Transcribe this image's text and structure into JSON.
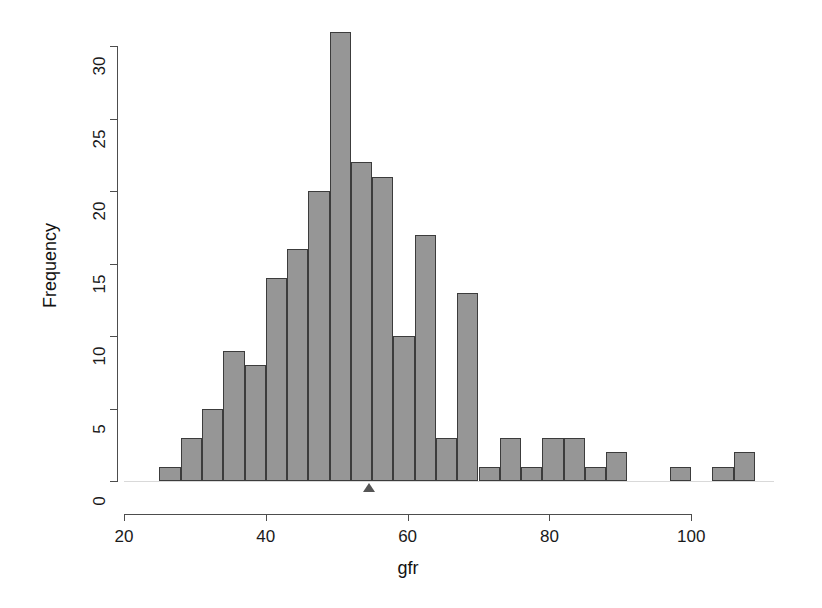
{
  "figure": {
    "width": 822,
    "height": 608,
    "background": "#ffffff",
    "bar_fill": "#969696",
    "bar_stroke": "#3c3c3c",
    "axis_color": "#4d4d4d"
  },
  "labels": {
    "xlabel": "gfr",
    "ylabel": "Frequency"
  },
  "chart_data": {
    "type": "bar",
    "subtype": "histogram",
    "title": "",
    "xlabel": "gfr",
    "ylabel": "Frequency",
    "xlim": [
      20,
      110
    ],
    "ylim": [
      0,
      31
    ],
    "grid": false,
    "legend": null,
    "bin_width": 3,
    "bin_edges": [
      25,
      28,
      31,
      34,
      37,
      40,
      43,
      46,
      49,
      52,
      55,
      58,
      61,
      64,
      67,
      70,
      73,
      76,
      79,
      82,
      85,
      88,
      91,
      94,
      97,
      100,
      103,
      106,
      109
    ],
    "categories": [
      "25-28",
      "28-31",
      "31-34",
      "34-37",
      "37-40",
      "40-43",
      "43-46",
      "46-49",
      "49-52",
      "52-55",
      "55-58",
      "58-61",
      "61-64",
      "64-67",
      "67-70",
      "70-73",
      "73-76",
      "76-79",
      "79-82",
      "82-85",
      "85-88",
      "88-91",
      "91-94",
      "94-97",
      "97-100",
      "100-103",
      "103-106",
      "106-109"
    ],
    "values": [
      1,
      3,
      5,
      9,
      8,
      14,
      16,
      20,
      31,
      22,
      21,
      10,
      17,
      3,
      13,
      1,
      3,
      1,
      3,
      3,
      1,
      2,
      0,
      0,
      1,
      0,
      1,
      2
    ],
    "xticks": [
      20,
      40,
      60,
      80,
      100
    ],
    "xtick_labels": [
      "20",
      "40",
      "60",
      "80",
      "100"
    ],
    "yticks": [
      0,
      5,
      10,
      15,
      20,
      25,
      30
    ],
    "ytick_labels": [
      "0",
      "5",
      "10",
      "15",
      "20",
      "25",
      "30"
    ],
    "annotations": [
      {
        "name": "mean-marker",
        "shape": "triangle",
        "x": 54.5,
        "y": 0
      }
    ]
  },
  "axes_geometry": {
    "x_origin_px": 124,
    "x_scale_px_per_unit": 7.09,
    "y_origin_px": 481,
    "y_scale_px_per_unit": 14.5
  }
}
